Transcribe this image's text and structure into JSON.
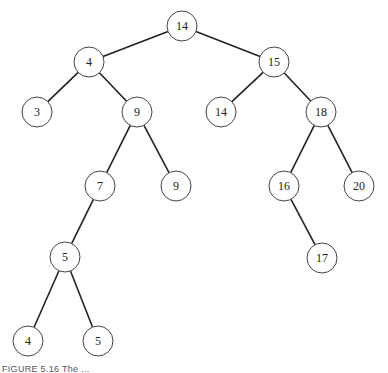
{
  "diagram": {
    "type": "binary-search-tree",
    "node_radius": 15,
    "stroke_color": "#222222",
    "nodes": [
      {
        "id": "n14",
        "label": "14",
        "x": 182,
        "y": 26
      },
      {
        "id": "n4",
        "label": "4",
        "x": 89,
        "y": 62
      },
      {
        "id": "n15",
        "label": "15",
        "x": 274,
        "y": 62
      },
      {
        "id": "n3",
        "label": "3",
        "x": 37,
        "y": 112
      },
      {
        "id": "n9a",
        "label": "9",
        "x": 137,
        "y": 112
      },
      {
        "id": "n14b",
        "label": "14",
        "x": 221,
        "y": 112
      },
      {
        "id": "n18",
        "label": "18",
        "x": 321,
        "y": 112
      },
      {
        "id": "n7",
        "label": "7",
        "x": 100,
        "y": 186
      },
      {
        "id": "n9b",
        "label": "9",
        "x": 176,
        "y": 186
      },
      {
        "id": "n16",
        "label": "16",
        "x": 284,
        "y": 186
      },
      {
        "id": "n20",
        "label": "20",
        "x": 359,
        "y": 186
      },
      {
        "id": "n5a",
        "label": "5",
        "x": 65,
        "y": 257
      },
      {
        "id": "n17",
        "label": "17",
        "x": 322,
        "y": 258
      },
      {
        "id": "n4b",
        "label": "4",
        "x": 28,
        "y": 341
      },
      {
        "id": "n5b",
        "label": "5",
        "x": 98,
        "y": 341
      }
    ],
    "edges": [
      [
        "n14",
        "n4"
      ],
      [
        "n14",
        "n15"
      ],
      [
        "n4",
        "n3"
      ],
      [
        "n4",
        "n9a"
      ],
      [
        "n9a",
        "n7"
      ],
      [
        "n9a",
        "n9b"
      ],
      [
        "n7",
        "n5a"
      ],
      [
        "n5a",
        "n4b"
      ],
      [
        "n5a",
        "n5b"
      ],
      [
        "n15",
        "n14b"
      ],
      [
        "n15",
        "n18"
      ],
      [
        "n18",
        "n16"
      ],
      [
        "n18",
        "n20"
      ],
      [
        "n16",
        "n17"
      ]
    ]
  },
  "caption": "FIGURE 5.16  The ..."
}
